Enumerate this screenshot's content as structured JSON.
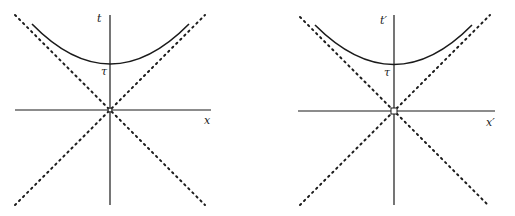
{
  "diagrams": [
    {
      "name": "unprimed-frame",
      "time_axis_label": "t",
      "space_axis_label": "x",
      "proper_time_label": "τ",
      "origin_marker": "circle"
    },
    {
      "name": "primed-frame",
      "time_axis_label": "t′",
      "space_axis_label": "x′",
      "proper_time_label": "τ",
      "origin_marker": "square"
    }
  ],
  "colors": {
    "line": "#1a1a1a",
    "background": "#ffffff"
  }
}
